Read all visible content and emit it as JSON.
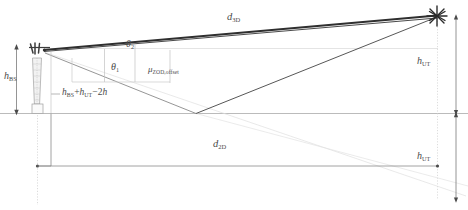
{
  "diagram": {
    "name": "3gpp-bs-ut-geometry",
    "colors": {
      "line_dark": "#3a3a3a",
      "line_mid": "#6f6f6f",
      "line_light": "#b9b9b9",
      "line_faint": "#d6d6d6",
      "text": "#4a4a4a",
      "background": "#ffffff"
    },
    "labels": {
      "d_3d": {
        "base": "d",
        "sub": "3D"
      },
      "d_2d": {
        "base": "d",
        "sub": "2D"
      },
      "h_bs": {
        "base": "h",
        "sub": "BS"
      },
      "h_ut_upper": {
        "base": "h",
        "sub": "UT"
      },
      "h_ut_lower": {
        "base": "h",
        "sub": "UT"
      },
      "theta_1": {
        "base": "θ",
        "sub": "1"
      },
      "theta_2": {
        "base": "θ",
        "sub": "2"
      },
      "mu_zod_offset": {
        "base": "μ",
        "sub": "ZOD,offset"
      },
      "height_sum": {
        "term1_base": "h",
        "term1_sub": "BS",
        "plus": "+",
        "term2_base": "h",
        "term2_sub": "UT",
        "minus": "−2",
        "term3": "h"
      }
    },
    "markers": {
      "ut_star": "star-burst-marker",
      "bs_antenna": "antenna-tower-icon"
    }
  }
}
